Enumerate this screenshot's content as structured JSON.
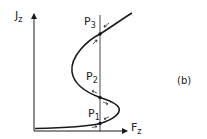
{
  "diagram": {
    "panel_label": "(b)",
    "axes": {
      "y_label": "J",
      "y_label_sub": "z",
      "x_label": "F",
      "x_label_sub": "z"
    },
    "points": [
      {
        "name": "P",
        "sub": "1"
      },
      {
        "name": "P",
        "sub": "2"
      },
      {
        "name": "P",
        "sub": "3"
      }
    ],
    "colors": {
      "line": "#1a1a1a",
      "background": "#ffffff"
    }
  }
}
